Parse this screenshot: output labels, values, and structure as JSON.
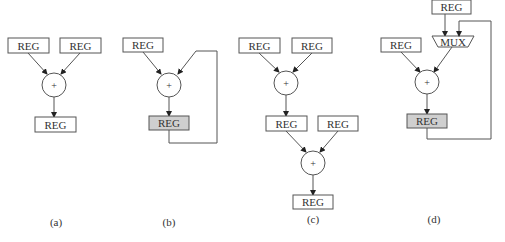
{
  "figure": {
    "reg_label": "REG",
    "mux_label": "MUX",
    "adder_symbol": "+",
    "panels": [
      {
        "id": "a",
        "caption": "(a)",
        "description": "Two REG inputs into adder, output to REG"
      },
      {
        "id": "b",
        "caption": "(b)",
        "description": "REG and feedback into adder, output to shaded REG (accumulator)"
      },
      {
        "id": "c",
        "caption": "(c)",
        "description": "Two-stage adder chain with intermediate REG"
      },
      {
        "id": "d",
        "caption": "(d)",
        "description": "REG and MUX into adder, output to shaded REG with feedback into MUX"
      }
    ]
  }
}
